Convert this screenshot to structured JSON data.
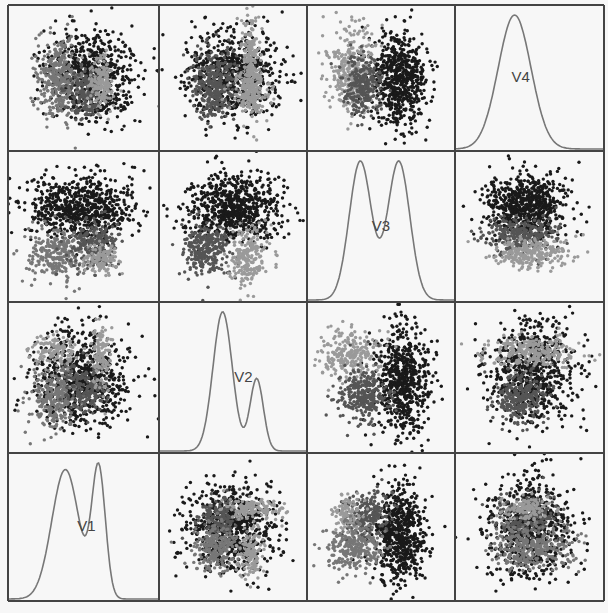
{
  "chart_data": {
    "type": "scatter",
    "title": "",
    "layout": "scatterplot-matrix",
    "grid": {
      "rows": 4,
      "cols": 4,
      "x_lines": [
        8,
        159,
        307,
        455,
        604
      ],
      "y_lines": [
        5,
        151,
        302,
        453,
        601
      ]
    },
    "variables": [
      "V1",
      "V2",
      "V3",
      "V4"
    ],
    "diagonal": "density",
    "diagonal_label_color": "#444444",
    "density_line_color": "#777777",
    "border_color": "#444444",
    "cluster_colors": [
      "#1a1a1a",
      "#555555",
      "#777777",
      "#9a9a9a"
    ],
    "cluster_names": [
      "cluster-1-black",
      "cluster-2-darkgray",
      "cluster-3-midgray",
      "cluster-4-lightgray"
    ],
    "panels": [
      {
        "row": 0,
        "col": 0,
        "x_var": "V1",
        "y_var": "V4",
        "type": "scatter",
        "clusters": [
          {
            "c": 0,
            "cx": 0.55,
            "cy": 0.48,
            "sx": 0.15,
            "sy": 0.16,
            "n": 650
          },
          {
            "c": 2,
            "cx": 0.33,
            "cy": 0.5,
            "sx": 0.07,
            "sy": 0.14,
            "n": 320
          },
          {
            "c": 1,
            "cx": 0.52,
            "cy": 0.6,
            "sx": 0.06,
            "sy": 0.09,
            "n": 170
          },
          {
            "c": 3,
            "cx": 0.62,
            "cy": 0.55,
            "sx": 0.04,
            "sy": 0.09,
            "n": 160
          }
        ]
      },
      {
        "row": 0,
        "col": 1,
        "x_var": "V2",
        "y_var": "V4",
        "type": "scatter",
        "clusters": [
          {
            "c": 0,
            "cx": 0.5,
            "cy": 0.48,
            "sx": 0.16,
            "sy": 0.15,
            "n": 650
          },
          {
            "c": 1,
            "cx": 0.38,
            "cy": 0.55,
            "sx": 0.08,
            "sy": 0.12,
            "n": 320
          },
          {
            "c": 3,
            "cx": 0.62,
            "cy": 0.4,
            "sx": 0.03,
            "sy": 0.18,
            "n": 220
          },
          {
            "c": 3,
            "cx": 0.62,
            "cy": 0.6,
            "sx": 0.07,
            "sy": 0.06,
            "n": 140
          }
        ]
      },
      {
        "row": 0,
        "col": 2,
        "x_var": "V3",
        "y_var": "V4",
        "type": "scatter",
        "clusters": [
          {
            "c": 0,
            "cx": 0.62,
            "cy": 0.5,
            "sx": 0.1,
            "sy": 0.15,
            "n": 650
          },
          {
            "c": 3,
            "cx": 0.3,
            "cy": 0.45,
            "sx": 0.08,
            "sy": 0.15,
            "n": 320
          },
          {
            "c": 1,
            "cx": 0.38,
            "cy": 0.55,
            "sx": 0.06,
            "sy": 0.1,
            "n": 260
          }
        ]
      },
      {
        "row": 0,
        "col": 3,
        "var": "V4",
        "type": "density",
        "label": "V4",
        "label_pos": [
          0.44,
          0.53
        ],
        "modes": [
          {
            "mu": 0.4,
            "sd": 0.11,
            "w": 1.0
          }
        ]
      },
      {
        "row": 1,
        "col": 0,
        "x_var": "V1",
        "y_var": "V3",
        "type": "scatter",
        "clusters": [
          {
            "c": 0,
            "cx": 0.48,
            "cy": 0.38,
            "sx": 0.18,
            "sy": 0.1,
            "n": 700
          },
          {
            "c": 2,
            "cx": 0.32,
            "cy": 0.68,
            "sx": 0.09,
            "sy": 0.09,
            "n": 260
          },
          {
            "c": 1,
            "cx": 0.58,
            "cy": 0.62,
            "sx": 0.08,
            "sy": 0.09,
            "n": 240
          },
          {
            "c": 3,
            "cx": 0.62,
            "cy": 0.72,
            "sx": 0.05,
            "sy": 0.05,
            "n": 120
          }
        ]
      },
      {
        "row": 1,
        "col": 1,
        "x_var": "V2",
        "y_var": "V3",
        "type": "scatter",
        "clusters": [
          {
            "c": 0,
            "cx": 0.5,
            "cy": 0.38,
            "sx": 0.16,
            "sy": 0.11,
            "n": 700
          },
          {
            "c": 1,
            "cx": 0.33,
            "cy": 0.65,
            "sx": 0.08,
            "sy": 0.09,
            "n": 280
          },
          {
            "c": 3,
            "cx": 0.6,
            "cy": 0.7,
            "sx": 0.06,
            "sy": 0.1,
            "n": 220
          }
        ]
      },
      {
        "row": 1,
        "col": 2,
        "var": "V3",
        "type": "density",
        "label": "V3",
        "label_pos": [
          0.5,
          0.53
        ],
        "modes": [
          {
            "mu": 0.36,
            "sd": 0.075,
            "w": 1.0
          },
          {
            "mu": 0.62,
            "sd": 0.075,
            "w": 1.0
          }
        ]
      },
      {
        "row": 1,
        "col": 3,
        "x_var": "V4",
        "y_var": "V3",
        "type": "scatter",
        "clusters": [
          {
            "c": 0,
            "cx": 0.48,
            "cy": 0.36,
            "sx": 0.13,
            "sy": 0.1,
            "n": 650
          },
          {
            "c": 1,
            "cx": 0.45,
            "cy": 0.56,
            "sx": 0.12,
            "sy": 0.06,
            "n": 280
          },
          {
            "c": 3,
            "cx": 0.52,
            "cy": 0.68,
            "sx": 0.14,
            "sy": 0.05,
            "n": 250
          }
        ]
      },
      {
        "row": 2,
        "col": 0,
        "x_var": "V1",
        "y_var": "V2",
        "type": "scatter",
        "clusters": [
          {
            "c": 0,
            "cx": 0.48,
            "cy": 0.5,
            "sx": 0.16,
            "sy": 0.16,
            "n": 700
          },
          {
            "c": 2,
            "cx": 0.32,
            "cy": 0.62,
            "sx": 0.08,
            "sy": 0.1,
            "n": 260
          },
          {
            "c": 1,
            "cx": 0.52,
            "cy": 0.58,
            "sx": 0.07,
            "sy": 0.08,
            "n": 180
          },
          {
            "c": 3,
            "cx": 0.3,
            "cy": 0.33,
            "sx": 0.08,
            "sy": 0.05,
            "n": 120
          },
          {
            "c": 3,
            "cx": 0.62,
            "cy": 0.35,
            "sx": 0.03,
            "sy": 0.12,
            "n": 120
          }
        ]
      },
      {
        "row": 2,
        "col": 1,
        "var": "V2",
        "type": "density",
        "label": "V2",
        "label_pos": [
          0.57,
          0.53
        ],
        "modes": [
          {
            "mu": 0.43,
            "sd": 0.065,
            "w": 1.0
          },
          {
            "mu": 0.66,
            "sd": 0.045,
            "w": 0.52
          }
        ]
      },
      {
        "row": 2,
        "col": 2,
        "x_var": "V3",
        "y_var": "V2",
        "type": "scatter",
        "clusters": [
          {
            "c": 0,
            "cx": 0.65,
            "cy": 0.52,
            "sx": 0.09,
            "sy": 0.18,
            "n": 650
          },
          {
            "c": 3,
            "cx": 0.3,
            "cy": 0.35,
            "sx": 0.1,
            "sy": 0.08,
            "n": 240
          },
          {
            "c": 1,
            "cx": 0.38,
            "cy": 0.62,
            "sx": 0.08,
            "sy": 0.09,
            "n": 280
          }
        ]
      },
      {
        "row": 2,
        "col": 3,
        "x_var": "V4",
        "y_var": "V2",
        "type": "scatter",
        "clusters": [
          {
            "c": 0,
            "cx": 0.52,
            "cy": 0.45,
            "sx": 0.15,
            "sy": 0.17,
            "n": 650
          },
          {
            "c": 3,
            "cx": 0.52,
            "cy": 0.33,
            "sx": 0.15,
            "sy": 0.05,
            "n": 250
          },
          {
            "c": 1,
            "cx": 0.43,
            "cy": 0.63,
            "sx": 0.09,
            "sy": 0.08,
            "n": 260
          }
        ]
      },
      {
        "row": 3,
        "col": 0,
        "var": "V1",
        "type": "density",
        "label": "V1",
        "label_pos": [
          0.52,
          0.53
        ],
        "modes": [
          {
            "mu": 0.38,
            "sd": 0.09,
            "w": 0.85
          },
          {
            "mu": 0.6,
            "sd": 0.045,
            "w": 0.85
          }
        ]
      },
      {
        "row": 3,
        "col": 1,
        "x_var": "V2",
        "y_var": "V1",
        "type": "scatter",
        "clusters": [
          {
            "c": 0,
            "cx": 0.5,
            "cy": 0.52,
            "sx": 0.15,
            "sy": 0.15,
            "n": 650
          },
          {
            "c": 1,
            "cx": 0.4,
            "cy": 0.43,
            "sx": 0.07,
            "sy": 0.07,
            "n": 160
          },
          {
            "c": 3,
            "cx": 0.62,
            "cy": 0.37,
            "sx": 0.1,
            "sy": 0.04,
            "n": 140
          },
          {
            "c": 2,
            "cx": 0.38,
            "cy": 0.63,
            "sx": 0.08,
            "sy": 0.08,
            "n": 220
          },
          {
            "c": 3,
            "cx": 0.62,
            "cy": 0.68,
            "sx": 0.04,
            "sy": 0.09,
            "n": 140
          }
        ]
      },
      {
        "row": 3,
        "col": 2,
        "x_var": "V3",
        "y_var": "V1",
        "type": "scatter",
        "clusters": [
          {
            "c": 0,
            "cx": 0.63,
            "cy": 0.55,
            "sx": 0.09,
            "sy": 0.17,
            "n": 650
          },
          {
            "c": 1,
            "cx": 0.4,
            "cy": 0.42,
            "sx": 0.08,
            "sy": 0.08,
            "n": 220
          },
          {
            "c": 3,
            "cx": 0.28,
            "cy": 0.4,
            "sx": 0.05,
            "sy": 0.06,
            "n": 100
          },
          {
            "c": 2,
            "cx": 0.33,
            "cy": 0.65,
            "sx": 0.1,
            "sy": 0.08,
            "n": 260
          }
        ]
      },
      {
        "row": 3,
        "col": 3,
        "x_var": "V4",
        "y_var": "V1",
        "type": "scatter",
        "clusters": [
          {
            "c": 0,
            "cx": 0.5,
            "cy": 0.5,
            "sx": 0.14,
            "sy": 0.17,
            "n": 650
          },
          {
            "c": 1,
            "cx": 0.48,
            "cy": 0.42,
            "sx": 0.11,
            "sy": 0.07,
            "n": 200
          },
          {
            "c": 3,
            "cx": 0.48,
            "cy": 0.38,
            "sx": 0.08,
            "sy": 0.04,
            "n": 120
          },
          {
            "c": 2,
            "cx": 0.52,
            "cy": 0.64,
            "sx": 0.15,
            "sy": 0.08,
            "n": 320
          }
        ]
      }
    ]
  }
}
